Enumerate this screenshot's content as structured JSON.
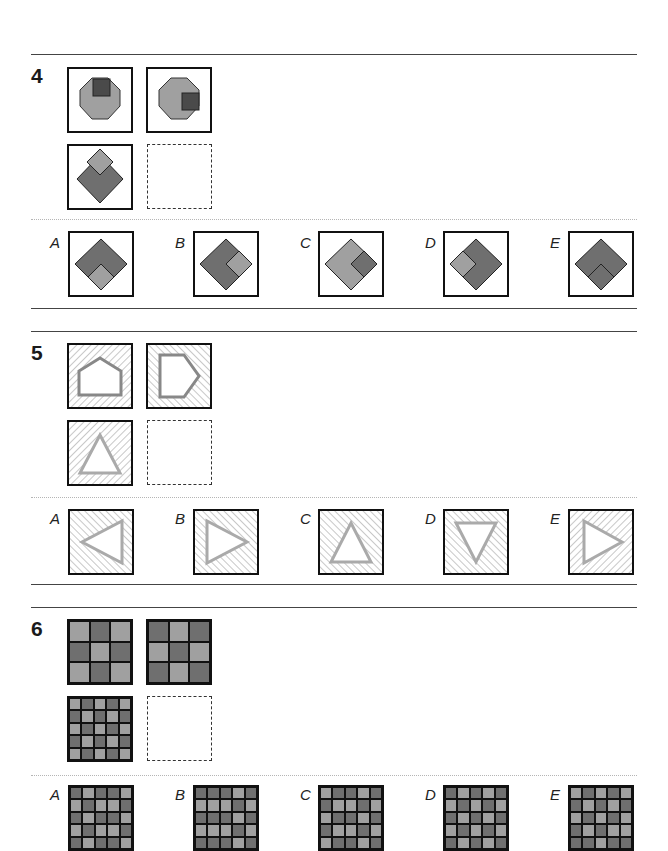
{
  "questions": [
    {
      "number": "4",
      "prompt_figures": [
        "octagon with dark square at top",
        "octagon with dark square at right",
        "dark diamond with light diamond at top",
        "empty answer slot"
      ],
      "options": [
        {
          "label": "A",
          "description": "dark diamond with light diamond at bottom"
        },
        {
          "label": "B",
          "description": "dark diamond with light diamond at right"
        },
        {
          "label": "C",
          "description": "light diamond with dark diamond at right"
        },
        {
          "label": "D",
          "description": "dark diamond with light diamond at left"
        },
        {
          "label": "E",
          "description": "dark diamond with dark diamond at bottom"
        }
      ]
    },
    {
      "number": "5",
      "prompt_figures": [
        "hatched square with pentagon pointing up",
        "hatched square with pentagon pointing right",
        "hatched square with triangle pointing up",
        "empty answer slot"
      ],
      "options": [
        {
          "label": "A",
          "description": "triangle pointing left"
        },
        {
          "label": "B",
          "description": "triangle pointing right"
        },
        {
          "label": "C",
          "description": "triangle pointing up"
        },
        {
          "label": "D",
          "description": "triangle pointing down"
        },
        {
          "label": "E",
          "description": "triangle pointing right, reversed hatch"
        }
      ]
    },
    {
      "number": "6",
      "prompt_figures": [
        {
          "size": 3,
          "rows": [
            "LDL",
            "DLD",
            "LDL"
          ]
        },
        {
          "size": 3,
          "rows": [
            "DLD",
            "LDL",
            "DLD"
          ]
        },
        {
          "size": 5,
          "rows": [
            "LDLDL",
            "DLDLD",
            "LDLDL",
            "DLDLD",
            "LDLDL"
          ]
        },
        "empty answer slot"
      ],
      "options": [
        {
          "label": "A",
          "rows": [
            "DLDDL",
            "LDLLD",
            "DLDDL",
            "LDLLD",
            "DLDDL"
          ]
        },
        {
          "label": "B",
          "rows": [
            "DDDLD",
            "LLLDL",
            "DDDLD",
            "LLLDL",
            "DDDLD"
          ]
        },
        {
          "label": "C",
          "rows": [
            "LDDLD",
            "DLLDL",
            "LDDLD",
            "DLLDL",
            "LDDLD"
          ]
        },
        {
          "label": "D",
          "rows": [
            "DLDLD",
            "LDLDL",
            "DLDLD",
            "LDLDL",
            "DLDLD"
          ]
        },
        {
          "label": "E",
          "rows": [
            "LDLDL",
            "DLDLD",
            "LDLDL",
            "DLDLL",
            "DDLDD"
          ]
        }
      ]
    }
  ],
  "colors": {
    "light_gray": "#a0a0a0",
    "dark_gray": "#6f6f6f",
    "darkest": "#4a4a4a",
    "outline": "#111111"
  }
}
